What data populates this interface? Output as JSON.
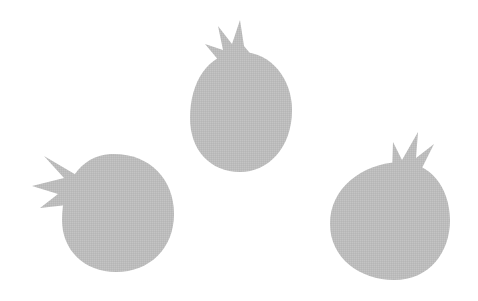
{
  "scene": {
    "background": "#ffffff",
    "fill_color": "#bdbdbd",
    "objects": [
      {
        "name": "pomegranate-top-center",
        "label": "Pomegranate"
      },
      {
        "name": "pomegranate-bottom-left",
        "label": "Pomegranate"
      },
      {
        "name": "pomegranate-bottom-right",
        "label": "Pomegranate"
      }
    ]
  }
}
